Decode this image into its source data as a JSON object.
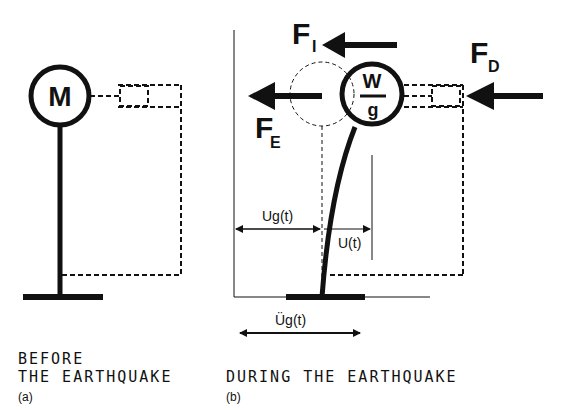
{
  "panel_a": {
    "mass_label": "M",
    "caption_line1": "BEFORE",
    "caption_line2": "THE EARTHQUAKE",
    "sublabel": "(a)"
  },
  "panel_b": {
    "mass_numerator": "W",
    "mass_denominator": "g",
    "force_inertia": {
      "main": "F",
      "sub": "I"
    },
    "force_elastic": {
      "main": "F",
      "sub": "E"
    },
    "force_damping": {
      "main": "F",
      "sub": "D"
    },
    "ground_displacement": "Ug(t)",
    "relative_displacement": "U(t)",
    "ground_acceleration": "Üg(t)",
    "caption": "DURING THE EARTHQUAKE",
    "sublabel": "(b)"
  },
  "colors": {
    "ink": "#111111",
    "background": "#ffffff"
  }
}
